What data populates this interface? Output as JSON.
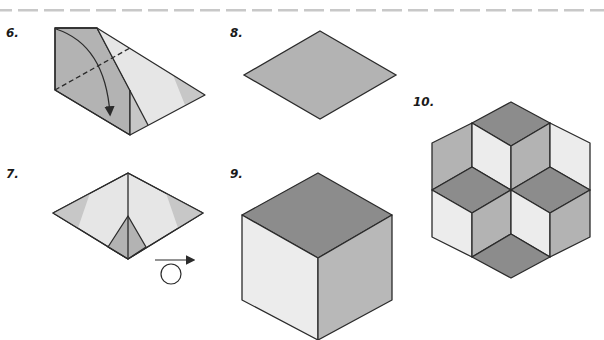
{
  "colors": {
    "dark": "#8c8c8c",
    "mid": "#b3b3b3",
    "light": "#e6e6e6",
    "medium_light": "#c7c7c7",
    "stroke": "#2b2b2b",
    "dash_bar": "#c8c8c8"
  },
  "steps": [
    {
      "label": "6.",
      "description": "Fold along dashed line, arrow shows fold direction"
    },
    {
      "label": "7.",
      "description": "Turn over"
    },
    {
      "label": "8.",
      "description": "Rhombus"
    },
    {
      "label": "9.",
      "description": "Cube made of three rhombi"
    },
    {
      "label": "10.",
      "description": "Hexagonal star pattern of rhombi"
    }
  ],
  "symbols": {
    "turn_over": "turn-over-icon",
    "fold_arrow": "curved-arrow-icon"
  }
}
